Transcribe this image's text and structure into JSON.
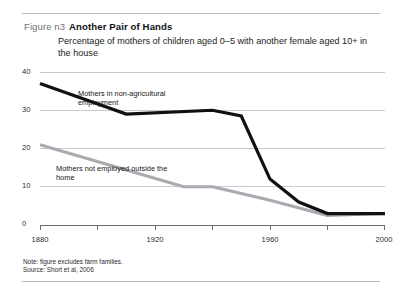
{
  "figure": {
    "number_label": "Figure n3",
    "title": "Another Pair of Hands",
    "subtitle": "Percentage of mothers of children aged 0–5 with another female aged 10+ in the house",
    "note": "Note: figure excludes farm families.",
    "source": "Source: Short et al, 2006"
  },
  "colors": {
    "series_black": "#111111",
    "series_gray": "#a8acb0",
    "gridline": "#c7cbcf",
    "rule": "#b9bdc1",
    "figure_number": "#6e7478"
  },
  "chart_data": {
    "type": "line",
    "title": "Another Pair of Hands",
    "subtitle": "Percentage of mothers of children aged 0–5 with another female aged 10+ in the house",
    "xlabel": "",
    "ylabel": "",
    "xlim": [
      1880,
      2000
    ],
    "ylim": [
      0,
      40
    ],
    "yticks": [
      0,
      10,
      20,
      30,
      40
    ],
    "ytick_labels": [
      "0",
      "10",
      "20",
      "30",
      "40"
    ],
    "xticks": [
      1880,
      1900,
      1920,
      1940,
      1960,
      1980,
      2000
    ],
    "xtick_labels": [
      "1880",
      "",
      "1920",
      "",
      "1960",
      "",
      "2000"
    ],
    "grid": true,
    "legend": "annotations-in-plot",
    "series": [
      {
        "name": "Mothers in non-agricultural employment",
        "color": "#111111",
        "x": [
          1880,
          1910,
          1940,
          1950,
          1960,
          1970,
          1980,
          2000
        ],
        "values": [
          37,
          29,
          30,
          28.5,
          12,
          6,
          3,
          3
        ]
      },
      {
        "name": "Mothers not employed outside the home",
        "color": "#a8acb0",
        "x": [
          1880,
          1930,
          1940,
          1960,
          1980,
          2000
        ],
        "values": [
          21,
          10,
          10,
          6.5,
          2.5,
          3
        ]
      }
    ],
    "annotations": [
      {
        "text": "Mothers in non-agricultural employment",
        "series": "black"
      },
      {
        "text": "Mothers not employed outside the home",
        "series": "gray"
      }
    ]
  }
}
